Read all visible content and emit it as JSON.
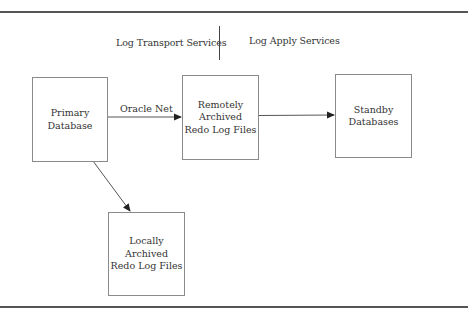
{
  "diagram": {
    "header": {
      "left_label": "Log Transport Services",
      "right_label": "Log Apply Services"
    },
    "nodes": [
      {
        "id": "primary",
        "label": "Primary\nDatabase"
      },
      {
        "id": "remote",
        "label": "Remotely\nArchived\nRedo Log Files"
      },
      {
        "id": "standby",
        "label": "Standby\nDatabases"
      },
      {
        "id": "local",
        "label": "Locally\nArchived\nRedo Log Files"
      }
    ],
    "edges": [
      {
        "from": "primary",
        "to": "remote",
        "label": "Oracle Net"
      },
      {
        "from": "remote",
        "to": "standby",
        "label": ""
      },
      {
        "from": "primary",
        "to": "local",
        "label": ""
      }
    ],
    "colors": {
      "rule": "#555555",
      "box_border": "#8a8a8a",
      "arrow": "#444444",
      "text": "#333333"
    }
  }
}
